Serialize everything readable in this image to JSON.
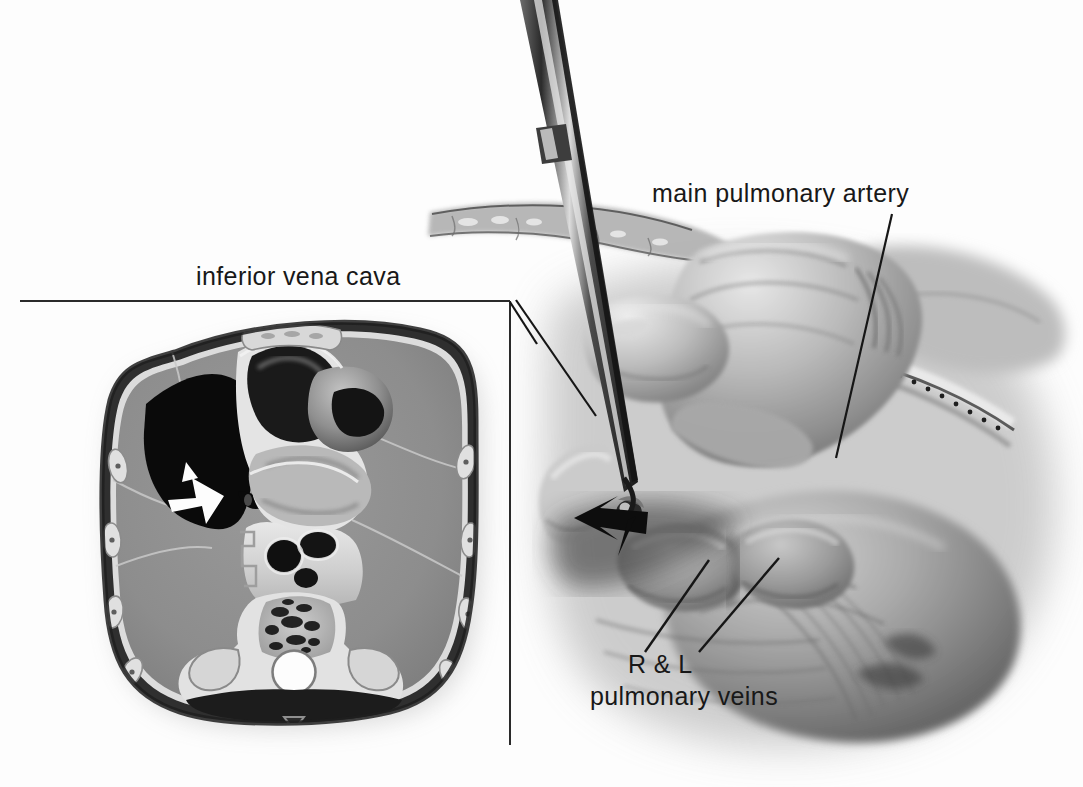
{
  "figure": {
    "kind": "surgical-anatomy-illustration",
    "background_color": "#fdfdfd",
    "ink_color": "#181818"
  },
  "labels": {
    "inferior_vena_cava": "inferior vena cava",
    "main_pulmonary_artery": "main pulmonary artery",
    "pulmonary_veins_line1": "R & L",
    "pulmonary_veins_line2": "pulmonary  veins"
  },
  "inset": {
    "name": "transverse thoracic cross-section",
    "frame": {
      "top_border": true,
      "right_border": true,
      "left_border": false,
      "bottom_border": false
    },
    "structures": [
      "body wall",
      "left lung field",
      "right lung field",
      "pericardial cavity",
      "white arrow marker",
      "mediastinal vessels",
      "vertebral body",
      "spinal canal",
      "ribs"
    ],
    "arrow_direction": "up-right"
  },
  "surgical_field": {
    "instrument": "suction dissector",
    "instrument_tip": "ball tip",
    "arrow_marker": "black arrowhead pointing left",
    "hands": [
      "gloved retracting hand",
      "gloved index finger"
    ],
    "tissues": [
      "pericardium",
      "pulmonary artery",
      "pulmonary veins",
      "vessel tape"
    ]
  },
  "leaders": {
    "ivc": "from label bracket down-right to vena cava",
    "mpa": "from label down-left to main pulmonary artery",
    "veins_right": "from R & L up-right to right pulmonary vein",
    "veins_left": "from R & L up-right to left pulmonary vein"
  }
}
